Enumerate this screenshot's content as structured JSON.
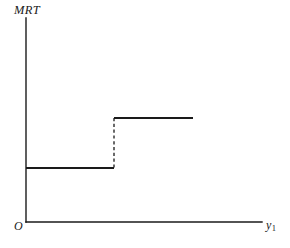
{
  "figure": {
    "background_color": "#ffffff",
    "line_color": "#1a1a1a",
    "width": 290,
    "height": 248
  },
  "labels": {
    "y_axis": "MRT",
    "origin": "O",
    "x_axis_base": "y",
    "x_axis_subscript": "1"
  },
  "chart_data": {
    "type": "line",
    "title": "",
    "xlabel": "y1",
    "ylabel": "MRT",
    "grid": false,
    "legend": null,
    "axis_origin_label": "O",
    "xlim": [
      0,
      10
    ],
    "ylim": [
      0,
      10
    ],
    "series": [
      {
        "name": "MRT",
        "style": "step",
        "segments": [
          {
            "name": "lower-step",
            "style": "solid",
            "x_start": 0.0,
            "x_end": 3.73,
            "y": 2.65
          },
          {
            "name": "upper-step",
            "style": "solid",
            "x_start": 3.73,
            "x_end": 7.08,
            "y": 5.1
          }
        ],
        "discontinuity": {
          "name": "jump-riser",
          "style": "dashed",
          "x": 3.73,
          "y_from": 2.65,
          "y_to": 5.1
        }
      }
    ]
  },
  "geometry": {
    "y_axis": {
      "x": 26,
      "y_top": 18,
      "y_bottom": 222
    },
    "x_axis": {
      "y": 222,
      "x_left": 26,
      "x_right": 262
    },
    "lower_step": {
      "y": 168,
      "x_start": 26,
      "x_end": 114
    },
    "upper_step": {
      "y": 118,
      "x_start": 114,
      "x_end": 193
    },
    "riser": {
      "x": 114,
      "y_top": 118,
      "y_bottom": 168
    }
  }
}
